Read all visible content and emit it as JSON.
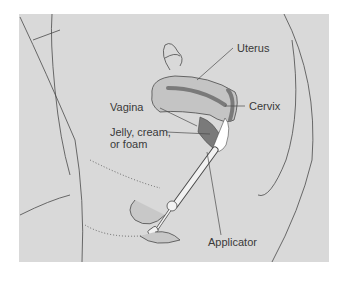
{
  "figure": {
    "type": "medical-illustration",
    "labels": {
      "uterus": "Uterus",
      "cervix": "Cervix",
      "vagina": "Vagina",
      "jelly_line1": "Jelly, cream,",
      "jelly_line2": "or foam",
      "applicator": "Applicator"
    },
    "colors": {
      "background": "#ffffff",
      "panel": "#d9d9d9",
      "outline": "#4a4a4a",
      "uterus_fill": "#c4c4c4",
      "dark_tissue": "#7a7a7a",
      "foam": "#ffffff"
    }
  }
}
